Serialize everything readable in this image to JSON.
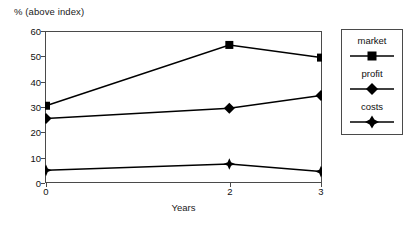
{
  "chart_data": {
    "type": "line",
    "title": "",
    "ylabel": "% (above index)",
    "xlabel": "Years",
    "x": [
      0,
      2,
      3
    ],
    "xtick_labels": [
      "0",
      "2",
      "3"
    ],
    "ytick_labels": [
      "0",
      "10",
      "20",
      "30",
      "40",
      "50",
      "60"
    ],
    "yticks": [
      0,
      10,
      20,
      30,
      40,
      50,
      60
    ],
    "ylim": [
      0,
      60
    ],
    "xlim": [
      0,
      3
    ],
    "grid": false,
    "legend_position": "right-outside",
    "series": [
      {
        "name": "market",
        "marker": "square",
        "color": "#000000",
        "values": [
          30.5,
          54.5,
          49.5
        ]
      },
      {
        "name": "profit",
        "marker": "diamond",
        "color": "#000000",
        "values": [
          25.5,
          29.5,
          34.5
        ]
      },
      {
        "name": "costs",
        "marker": "star-diamond",
        "color": "#000000",
        "values": [
          5.0,
          7.5,
          4.5
        ]
      }
    ]
  },
  "legend": {
    "entries": [
      {
        "label": "market"
      },
      {
        "label": "profit"
      },
      {
        "label": "costs"
      }
    ]
  }
}
